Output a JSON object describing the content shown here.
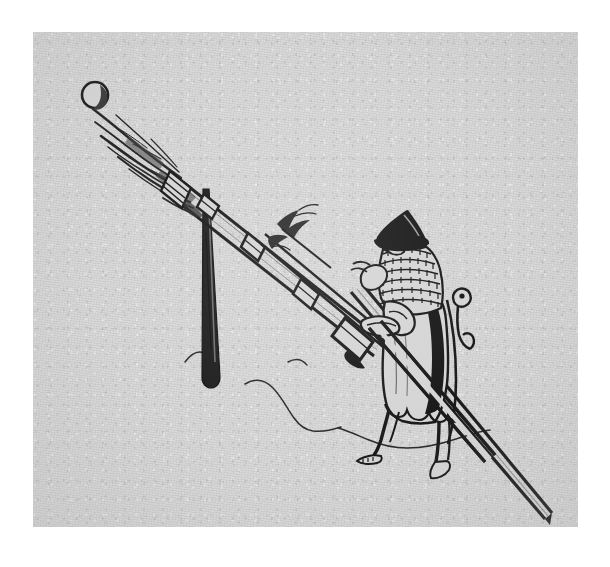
{
  "document": {
    "type": "historical-engraving",
    "title": "Medieval gunner firing a bombard",
    "caption": "",
    "medium": "line engraving on toned paper",
    "background_color": "#d5d5d5",
    "ink_color": "#1a1a1a",
    "page_color": "#ffffff"
  },
  "plate": {
    "x": 33,
    "y": 32,
    "width": 545,
    "height": 495
  },
  "scene": {
    "subjects": [
      {
        "name": "cannonball",
        "label": "Cannonball in flight",
        "description": "small dark circle with crescent shading, just clear of the muzzle",
        "position": {
          "x": 62,
          "y": 63
        },
        "radius": 13
      },
      {
        "name": "muzzle-blast",
        "label": "Muzzle blast",
        "description": "streaky flame and smoke plume radiating up-left from the muzzle"
      },
      {
        "name": "bombard-barrel",
        "label": "Bombard barrel",
        "description": "tapered tube angled from lower-right to upper-left, bound with reinforcing rings"
      },
      {
        "name": "touch-hole-flame",
        "label": "Touch-hole flame",
        "description": "small spark plume rising from the breech vent"
      },
      {
        "name": "support-stake",
        "label": "Wooden support stake",
        "description": "vertical prop driven into the ground supporting the barrel"
      },
      {
        "name": "gunner",
        "label": "Gunner",
        "description": "standing figure in kettle hat and mail aventail, gripping the breech and a linstock"
      },
      {
        "name": "linstock-pole",
        "label": "Linstock pole",
        "description": "long straight pole running from the gunner's hands to the lower-right corner"
      },
      {
        "name": "ground-line",
        "label": "Ground contour",
        "description": "thin wavy hillock lines across the lower middle of the plate"
      }
    ],
    "gunner_attire": [
      {
        "name": "kettle-hat",
        "label": "Pointed kettle hat"
      },
      {
        "name": "mail-aventail",
        "label": "Mail aventail / cape"
      },
      {
        "name": "tunic",
        "label": "Long tunic with scalloped hem"
      },
      {
        "name": "hose",
        "label": "Hose and pointed shoes"
      },
      {
        "name": "belt-pouch",
        "label": "Hanging belt fitting"
      }
    ]
  }
}
